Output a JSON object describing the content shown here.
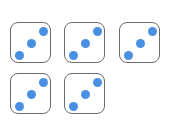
{
  "diagram": {
    "dot_color": "#4a90e2",
    "border_color": "#6b6b6b",
    "dice": [
      {
        "value": 3,
        "x": 10,
        "y": 22
      },
      {
        "value": 3,
        "x": 64,
        "y": 22
      },
      {
        "value": 3,
        "x": 119,
        "y": 22
      },
      {
        "value": 3,
        "x": 10,
        "y": 73
      },
      {
        "value": 3,
        "x": 64,
        "y": 73
      }
    ]
  }
}
